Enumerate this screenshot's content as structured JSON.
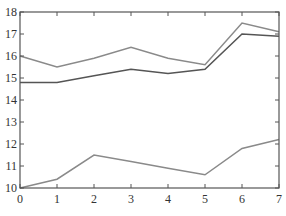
{
  "chart_data": {
    "type": "line",
    "title": "",
    "xlabel": "",
    "ylabel": "",
    "x": [
      0,
      1,
      2,
      3,
      4,
      5,
      6,
      7
    ],
    "xlim": [
      0,
      7
    ],
    "ylim": [
      10,
      18
    ],
    "xticks": [
      0,
      1,
      2,
      3,
      4,
      5,
      6,
      7
    ],
    "yticks": [
      10,
      11,
      12,
      13,
      14,
      15,
      16,
      17,
      18
    ],
    "grid": false,
    "legend": null,
    "series": [
      {
        "name": "series-top",
        "color": "#8a8a8a",
        "values": [
          16.0,
          15.5,
          15.9,
          16.4,
          15.9,
          15.6,
          17.5,
          17.1
        ]
      },
      {
        "name": "series-middle",
        "color": "#555555",
        "values": [
          14.8,
          14.8,
          15.1,
          15.4,
          15.2,
          15.4,
          17.0,
          16.9
        ]
      },
      {
        "name": "series-bottom",
        "color": "#8a8a8a",
        "values": [
          10.0,
          10.4,
          11.5,
          11.2,
          10.9,
          10.6,
          11.8,
          12.2
        ]
      }
    ]
  },
  "colors": {
    "axis": "#555555",
    "text": "#333333",
    "background": "#ffffff"
  }
}
